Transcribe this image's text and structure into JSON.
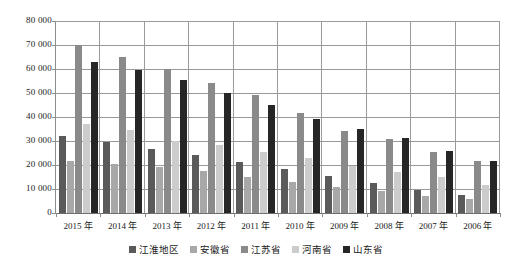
{
  "chart_data": {
    "type": "bar",
    "title": "",
    "subtitle": "",
    "xlabel": "",
    "ylabel": "",
    "ylim": [
      0,
      80000
    ],
    "ytick_step": 10000,
    "ytick_labels": [
      "80 000",
      "70 000",
      "60 000",
      "50 000",
      "40 000",
      "30 000",
      "20 000",
      "10 000",
      "0"
    ],
    "ytick_values": [
      80000,
      70000,
      60000,
      50000,
      40000,
      30000,
      20000,
      10000,
      0
    ],
    "grid": true,
    "legend_position": "bottom",
    "categories": [
      "2015 年",
      "2014 年",
      "2013 年",
      "2012 年",
      "2011 年",
      "2010 年",
      "2009 年",
      "2008 年",
      "2007 年",
      "2006 年"
    ],
    "series": [
      {
        "name": "江淮地区",
        "color": "#5a5a5a",
        "values": [
          32200,
          29700,
          26700,
          24100,
          21200,
          18400,
          15600,
          12300,
          9400,
          7500
        ]
      },
      {
        "name": "安徽省",
        "color": "#a8a8a8",
        "values": [
          21500,
          20500,
          19200,
          17600,
          15100,
          12900,
          11000,
          9000,
          7200,
          5900
        ]
      },
      {
        "name": "江苏省",
        "color": "#8a8a8a",
        "values": [
          70000,
          65000,
          60000,
          54000,
          49000,
          41500,
          34000,
          30700,
          25500,
          21500
        ]
      },
      {
        "name": "河南省",
        "color": "#cccccc",
        "values": [
          37000,
          34700,
          30000,
          28500,
          25500,
          22900,
          19500,
          17200,
          15000,
          11500
        ]
      },
      {
        "name": "山东省",
        "color": "#262626",
        "values": [
          63000,
          59500,
          55500,
          50000,
          45000,
          39000,
          35000,
          31200,
          26000,
          21700
        ]
      }
    ]
  },
  "legend": {
    "items": [
      {
        "label": "江淮地区",
        "series_index": 0
      },
      {
        "label": "安徽省",
        "series_index": 1
      },
      {
        "label": "江苏省",
        "series_index": 2
      },
      {
        "label": "河南省",
        "series_index": 3
      },
      {
        "label": "山东省",
        "series_index": 4
      }
    ]
  }
}
